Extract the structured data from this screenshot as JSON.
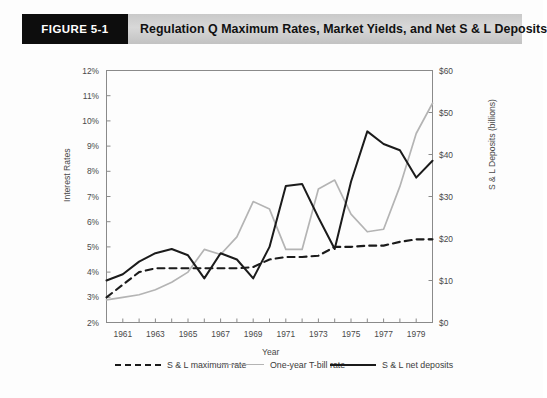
{
  "banner": {
    "figure_tag": "FIGURE 5-1",
    "title": "Regulation Q Maximum Rates, Market Yields, and Net S & L Deposits"
  },
  "chart_data": {
    "type": "line",
    "title": "Regulation Q Maximum Rates, Market Yields, and Net S & L Deposits",
    "xlabel": "Year",
    "ylabel": "Interest Rates",
    "ylabel_right": "S & L Deposits (billions)",
    "grid": false,
    "legend_position": "bottom",
    "xlim": [
      1960,
      1980
    ],
    "ylim": [
      2,
      12
    ],
    "ylim_right": [
      0,
      60
    ],
    "x": [
      1960,
      1961,
      1962,
      1963,
      1964,
      1965,
      1966,
      1967,
      1968,
      1969,
      1970,
      1971,
      1972,
      1973,
      1974,
      1975,
      1976,
      1977,
      1978,
      1979,
      1980
    ],
    "xticks": [
      1961,
      1963,
      1965,
      1967,
      1969,
      1971,
      1973,
      1975,
      1977,
      1979
    ],
    "xtick_labels": [
      "1961",
      "1963",
      "1965",
      "1967",
      "1969",
      "1971",
      "1973",
      "1975",
      "1977",
      "1979"
    ],
    "yticks": [
      2,
      3,
      4,
      5,
      6,
      7,
      8,
      9,
      10,
      11,
      12
    ],
    "ytick_labels": [
      "2%",
      "3%",
      "4%",
      "5%",
      "6%",
      "7%",
      "8%",
      "9%",
      "10%",
      "11%",
      "12%"
    ],
    "yticks_right": [
      0,
      10,
      20,
      30,
      40,
      50,
      60
    ],
    "ytick_labels_right": [
      "$0",
      "$10",
      "$20",
      "$30",
      "$40",
      "$50",
      "$60"
    ],
    "series": [
      {
        "name": "S & L maximum rate",
        "axis": "left",
        "style": "dashed",
        "color": "#1b1b1b",
        "unit": "percent",
        "values": [
          3.0,
          3.5,
          4.0,
          4.15,
          4.15,
          4.15,
          4.15,
          4.15,
          4.15,
          4.2,
          4.5,
          4.6,
          4.6,
          4.65,
          5.0,
          5.0,
          5.05,
          5.05,
          5.2,
          5.3,
          5.3
        ]
      },
      {
        "name": "One-year T-bill rate",
        "axis": "left",
        "style": "solid",
        "color": "#b4b4b4",
        "unit": "percent",
        "values": [
          2.9,
          3.0,
          3.1,
          3.3,
          3.6,
          4.0,
          4.9,
          4.7,
          5.4,
          6.8,
          6.5,
          4.9,
          4.9,
          7.3,
          7.65,
          6.3,
          5.6,
          5.7,
          7.4,
          9.5,
          10.7
        ]
      },
      {
        "name": "S & L net deposits",
        "axis": "right",
        "style": "solid",
        "color": "#1b1b1b",
        "unit": "billions",
        "values": [
          10.0,
          11.5,
          14.5,
          16.5,
          17.5,
          16.0,
          10.5,
          16.5,
          15.0,
          10.5,
          18.0,
          32.5,
          33.0,
          25.0,
          17.5,
          33.5,
          45.5,
          42.5,
          41.0,
          34.5,
          38.5
        ]
      }
    ]
  },
  "legend": {
    "items": [
      {
        "label": "S & L maximum rate",
        "swatch": "dashed-line-swatch"
      },
      {
        "label": "One-year T-bill rate",
        "swatch": "gray-line-swatch"
      },
      {
        "label": "S & L net deposits",
        "swatch": "black-line-swatch"
      }
    ]
  }
}
